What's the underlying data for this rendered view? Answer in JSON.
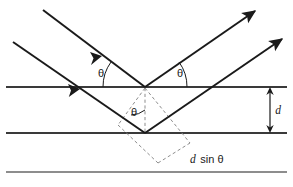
{
  "figure": {
    "type": "physics-ray-diagram",
    "canvas": {
      "width": 293,
      "height": 187,
      "background": "#ffffff"
    },
    "colors": {
      "ray": "#1a1a1a",
      "plane": "#3a3a3a",
      "plane_faint": "#8d8d8d",
      "dashed": "#8d8d8d",
      "text": "#1a1a1a"
    },
    "labels": {
      "theta_incident": "θ",
      "theta_reflected": "θ",
      "theta_interior": "θ",
      "spacing": "d",
      "path_difference_italic": "d",
      "path_difference_rest": " sin θ"
    },
    "geometry": {
      "planes": [
        {
          "name": "plane-top",
          "y": 87,
          "x1": 6,
          "x2": 287,
          "weight": 2.0,
          "color": "#3a3a3a"
        },
        {
          "name": "plane-middle",
          "y": 133,
          "x1": 6,
          "x2": 287,
          "weight": 2.0,
          "color": "#3a3a3a"
        },
        {
          "name": "plane-bottom",
          "y": 172,
          "x1": 6,
          "x2": 287,
          "weight": 2.0,
          "color": "#8d8d8d"
        }
      ],
      "vertex_top": {
        "x": 145,
        "y": 87
      },
      "vertex_lower": {
        "x": 145,
        "y": 133
      },
      "incident_ray_1": {
        "x1": 43,
        "y1": 10,
        "x2": 145,
        "y2": 87,
        "arrow_t": 0.5
      },
      "incident_ray_2": {
        "x1": 13,
        "y1": 42,
        "x2": 145,
        "y2": 133,
        "arrow_t": 0.47
      },
      "reflected_ray_1": {
        "x1": 145,
        "y1": 87,
        "x2": 258,
        "y2": 9
      },
      "reflected_ray_2": {
        "x1": 145,
        "y1": 133,
        "x2": 285,
        "y2": 37
      },
      "dimension_arrow": {
        "x": 270,
        "y1": 87,
        "y2": 133
      },
      "angle_arcs": [
        {
          "name": "arc-theta-incident",
          "cx": 145,
          "cy": 87,
          "r": 42,
          "start_deg": 180,
          "end_deg": 217
        },
        {
          "name": "arc-theta-reflected",
          "cx": 145,
          "cy": 87,
          "r": 42,
          "start_deg": 0,
          "end_deg": -35
        },
        {
          "name": "arc-theta-interior",
          "cx": 145,
          "cy": 133,
          "r": 23,
          "start_deg": -90,
          "end_deg": -127
        }
      ],
      "label_positions": {
        "theta_incident": {
          "x": 101,
          "y": 77
        },
        "theta_reflected": {
          "x": 176,
          "y": 77
        },
        "theta_interior": {
          "x": 132,
          "y": 115
        },
        "spacing_d": {
          "x": 276,
          "y": 114
        },
        "path_difference": {
          "x": 196,
          "y": 163
        }
      }
    }
  }
}
